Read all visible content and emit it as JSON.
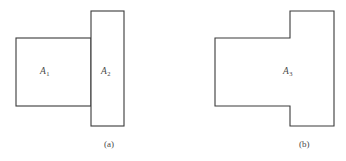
{
  "figure": {
    "background_color": "#ffffff",
    "stroke_color": "#3a3a3a",
    "text_color": "#4a4a4a",
    "panels": [
      {
        "id": "panel-a",
        "caption": "(a)",
        "description": "Two adjacent rectangles sharing a common vertical edge",
        "regions": [
          {
            "name": "A1",
            "label_main": "A",
            "label_sub": "1",
            "shape": "rectangle",
            "x": 16,
            "y": 38,
            "width": 75,
            "height": 68
          },
          {
            "name": "A2",
            "label_main": "A",
            "label_sub": "2",
            "shape": "rectangle",
            "x": 91,
            "y": 11,
            "width": 33,
            "height": 115
          }
        ]
      },
      {
        "id": "panel-b",
        "caption": "(b)",
        "description": "Union of the two rectangles forming a stepped T-shaped polygon",
        "regions": [
          {
            "name": "A3",
            "label_main": "A",
            "label_sub": "3",
            "shape": "polygon",
            "points": "290,11 334,11 334,126 290,126 290,106 215,106 215,38 290,38"
          }
        ]
      }
    ]
  }
}
